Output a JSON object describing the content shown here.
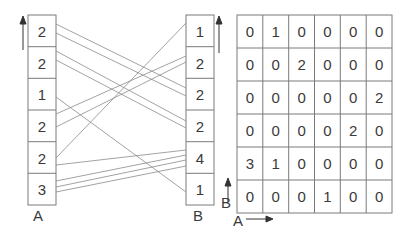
{
  "array_a": {
    "label": "A",
    "values_top_to_bottom": [
      "2",
      "2",
      "1",
      "2",
      "2",
      "3"
    ]
  },
  "array_b": {
    "label": "B",
    "values_top_to_bottom": [
      "1",
      "2",
      "2",
      "2",
      "4",
      "1"
    ]
  },
  "matrix": {
    "row_axis_label": "B",
    "col_axis_label": "A",
    "rows": [
      [
        "0",
        "1",
        "0",
        "0",
        "0",
        "0"
      ],
      [
        "0",
        "0",
        "2",
        "0",
        "0",
        "0"
      ],
      [
        "0",
        "0",
        "0",
        "0",
        "0",
        "2"
      ],
      [
        "0",
        "0",
        "0",
        "0",
        "2",
        "0"
      ],
      [
        "3",
        "1",
        "0",
        "0",
        "0",
        "0"
      ],
      [
        "0",
        "0",
        "0",
        "1",
        "0",
        "0"
      ]
    ]
  },
  "colors": {
    "stroke": "#777777",
    "line": "#8a8a8a",
    "text": "#3a3a3a"
  }
}
